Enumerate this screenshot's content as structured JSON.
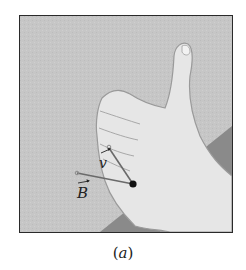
{
  "figure": {
    "caption_open": "(",
    "caption_letter": "a",
    "caption_close": ")"
  },
  "vectors": {
    "v": {
      "label": "v",
      "has_arrow_accent": true
    },
    "B": {
      "label": "B",
      "has_arrow_accent": true
    }
  },
  "colors": {
    "background": "#c4c4c4",
    "wall_stripe": "#8a8a8a",
    "skin": "#e6e6e6",
    "skin_outline": "#9a9a9a",
    "vector_line": "#6a6a6a",
    "dot": "#111111",
    "frame_border": "#2a2a2a"
  }
}
